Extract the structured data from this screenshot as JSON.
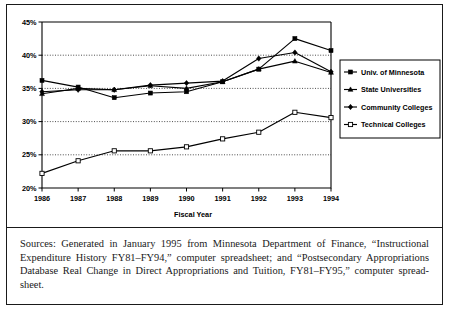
{
  "chart_data": {
    "type": "line",
    "title": "",
    "xlabel": "Fiscal Year",
    "ylabel": "",
    "categories": [
      "1986",
      "1987",
      "1988",
      "1989",
      "1990",
      "1991",
      "1992",
      "1993",
      "1994"
    ],
    "x": [
      1986,
      1987,
      1988,
      1989,
      1990,
      1991,
      1992,
      1993,
      1994
    ],
    "ylim": [
      20,
      45
    ],
    "yticks": [
      20,
      25,
      30,
      35,
      40,
      45
    ],
    "ytick_labels": [
      "20%",
      "25%",
      "30%",
      "35%",
      "40%",
      "45%"
    ],
    "grid": "horizontal-dotted",
    "legend_position": "right",
    "series": [
      {
        "name": "Univ. of Minnesota",
        "marker": "filled-square",
        "values": [
          36.2,
          35.2,
          33.6,
          34.3,
          34.5,
          36.0,
          37.9,
          42.5,
          40.7
        ]
      },
      {
        "name": "State Universities",
        "marker": "filled-triangle",
        "values": [
          34.2,
          35.0,
          34.8,
          35.4,
          35.0,
          36.0,
          37.9,
          39.1,
          37.4
        ]
      },
      {
        "name": "Community Colleges",
        "marker": "filled-diamond",
        "values": [
          34.5,
          34.8,
          34.8,
          35.5,
          35.8,
          36.1,
          39.5,
          40.4,
          37.5
        ]
      },
      {
        "name": "Technical Colleges",
        "marker": "hollow-square",
        "values": [
          22.2,
          24.1,
          25.6,
          25.6,
          26.2,
          27.4,
          28.4,
          31.4,
          30.6
        ]
      }
    ]
  },
  "axis": {
    "x_title": "Fiscal Year"
  },
  "legend": {
    "entries": [
      "Univ. of Minnesota",
      "State Universities",
      "Community Colleges",
      "Technical Colleges"
    ]
  },
  "sources": {
    "text": "Sources: Generated in January 1995 from Minnesota Department of Finance, “Instructional Expenditure History FY81–FY94,” computer spreadsheet; and “Postsecondary Appropriations Database Real Change in Direct Appropriations and Tuition, FY81–FY95,” computer spread-sheet."
  },
  "colors": {
    "ink": "#000000",
    "background": "#ffffff",
    "border": "#1a1a1a"
  }
}
